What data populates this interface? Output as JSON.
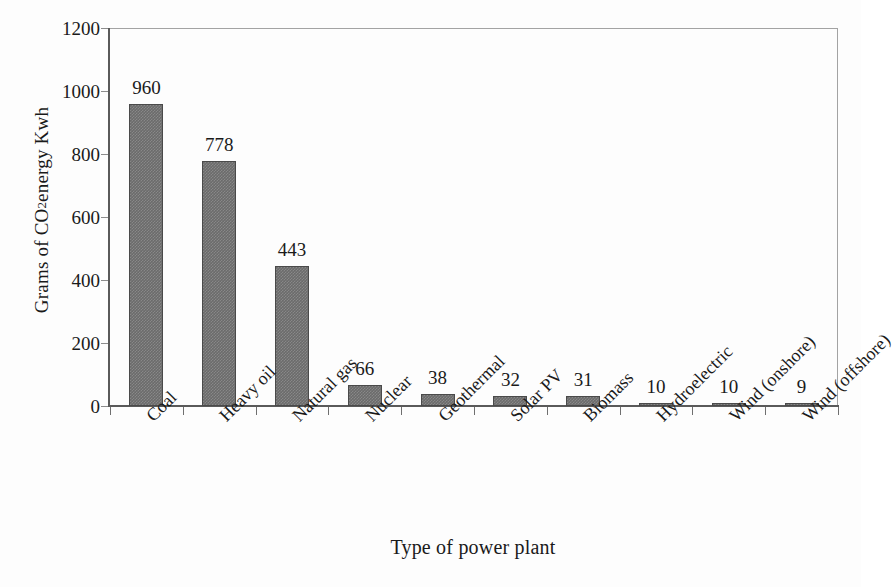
{
  "chart_data": {
    "type": "bar",
    "title": "",
    "xlabel": "Type of power plant",
    "ylabel": "Grams of CO2 energy Kwh",
    "ylabel_parts": {
      "pre": "Grams of CO",
      "sub": "2",
      "post": " energy Kwh"
    },
    "categories": [
      "Coal",
      "Heavy oil",
      "Natural gas",
      "Nuclear",
      "Geothermal",
      "Solar PV",
      "Biomass",
      "Hydroelectric",
      "Wind (onshore)",
      "Wind (offshore)"
    ],
    "values": [
      960,
      778,
      443,
      66,
      38,
      32,
      31,
      10,
      10,
      9
    ],
    "data_labels": [
      "960",
      "778",
      "443",
      "66",
      "38",
      "32",
      "31",
      "10",
      "10",
      "9"
    ],
    "ylim": [
      0,
      1200
    ],
    "ytick_values": [
      0,
      200,
      400,
      600,
      800,
      1000,
      1200
    ],
    "ytick_labels": [
      "0",
      "200",
      "400",
      "600",
      "800",
      "1000",
      "1200"
    ],
    "grid": false,
    "legend": false,
    "legend_position": "none",
    "bar_color": "#6b6b6b",
    "axis_color": "#5a5a5a",
    "background_color": "#fdfdfd",
    "xtick_rotation_degrees": -45,
    "series": [
      {
        "name": "CO2 emissions",
        "values": [
          960,
          778,
          443,
          66,
          38,
          32,
          31,
          10,
          10,
          9
        ]
      }
    ]
  }
}
